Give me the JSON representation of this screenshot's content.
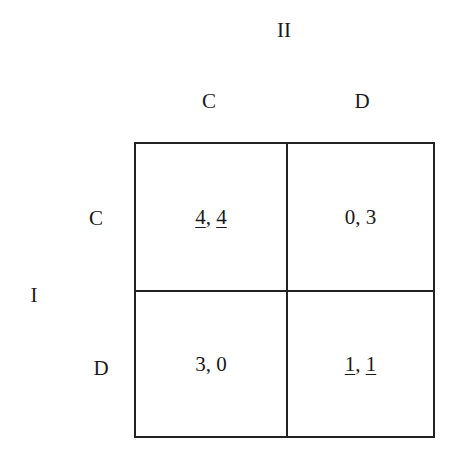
{
  "players": {
    "column_player": "II",
    "row_player": "I"
  },
  "column_strategies": [
    "C",
    "D"
  ],
  "row_strategies": [
    "C",
    "D"
  ],
  "payoffs": [
    [
      {
        "p1": "4",
        "p1_underlined": true,
        "sep": ", ",
        "p2": "4",
        "p2_underlined": true
      },
      {
        "p1": "0",
        "p1_underlined": false,
        "sep": ", ",
        "p2": "3",
        "p2_underlined": false
      }
    ],
    [
      {
        "p1": "3",
        "p1_underlined": false,
        "sep": ", ",
        "p2": "0",
        "p2_underlined": false
      },
      {
        "p1": "1",
        "p1_underlined": true,
        "sep": ", ",
        "p2": "1",
        "p2_underlined": true
      }
    ]
  ],
  "colors": {
    "line": "#222222",
    "text": "#1a1a1a",
    "background": "#ffffff"
  }
}
